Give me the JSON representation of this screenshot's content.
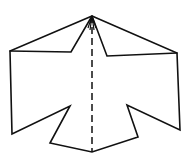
{
  "diagram": {
    "type": "line-drawing",
    "colors": {
      "stroke": "#111111",
      "background": "#ffffff"
    },
    "points": {
      "apex": [
        92,
        16
      ],
      "left_outer_top": [
        10,
        51
      ],
      "left_notch_top": [
        71,
        52
      ],
      "right_notch_top": [
        107,
        56
      ],
      "right_outer_top": [
        177,
        53
      ],
      "left_outer_bottom": [
        12,
        134
      ],
      "left_notch_bottom": [
        70,
        106
      ],
      "left_tail_bottom": [
        50,
        143
      ],
      "bottom_center": [
        92,
        152
      ],
      "right_tail_bottom": [
        138,
        137
      ],
      "right_notch_bottom": [
        127,
        105
      ],
      "right_outer_bottom": [
        180,
        130
      ]
    },
    "outline_path": "M92,16 L10,51 L12,134 L70,106 L50,143 L92,152 L138,137 L127,105 L180,130 L177,53 L92,16",
    "inner_edges_path": "M10,51 L71,52 L92,16 M92,16 L107,56 L177,53",
    "apex_creases_path": "M92,16 L88,28 M92,16 L96,28 M92,16 L90,30 M92,16 L94,30",
    "fold_line": {
      "style": "dashed",
      "from": [
        92,
        16
      ],
      "to": [
        92,
        152
      ]
    }
  }
}
